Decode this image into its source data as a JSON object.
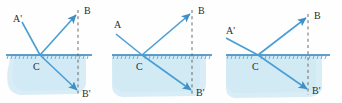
{
  "figure": {
    "panel_count": 3,
    "colors": {
      "ray": "#4a9ed4",
      "ray_dark": "#3f8ec4",
      "interface": "#2f7fb5",
      "water_fill": "#d9edf6",
      "water_fill_alt": "#cfe8f4",
      "normal_dashed": "#6a6a6a",
      "label": "#2b2b2b",
      "background": "#fefefe"
    }
  },
  "panels": [
    {
      "id": "panel-1",
      "name": "left-panel",
      "labels": {
        "source": "A'",
        "image_above": "B",
        "image_below": "B'",
        "interface_point": "C"
      },
      "geometry": {
        "interface_y": 55,
        "point_c_x": 40,
        "normal_x": 78,
        "b_y": 12,
        "b_prime_y": 92,
        "source_x": 14,
        "source_y": 18
      },
      "rays": [
        {
          "name": "incident-ray",
          "from": "A'",
          "to": "C",
          "arrow": false
        },
        {
          "name": "reflected-ray",
          "from": "C",
          "to": "B",
          "arrow": true
        },
        {
          "name": "through-ray",
          "from": "C",
          "to": "B'",
          "arrow": true
        }
      ]
    },
    {
      "id": "panel-2",
      "name": "middle-panel",
      "labels": {
        "source": "A",
        "image_above": "B",
        "image_below": "B'",
        "interface_point": "C"
      },
      "geometry": {
        "interface_y": 55,
        "point_c_x": 30,
        "normal_x": 80,
        "b_y": 12,
        "b_prime_y": 92,
        "source_x": 8,
        "source_y": 30
      },
      "rays": [
        {
          "name": "incident-ray",
          "from": "A",
          "to": "C",
          "arrow": false
        },
        {
          "name": "reflected-ray",
          "from": "C",
          "to": "B",
          "arrow": true
        },
        {
          "name": "refracted-ray",
          "from": "C",
          "to": "B'",
          "arrow": true
        }
      ]
    },
    {
      "id": "panel-3",
      "name": "right-panel",
      "labels": {
        "source": "A'",
        "image_above": "B",
        "image_below": "B'",
        "interface_point": "C"
      },
      "geometry": {
        "interface_y": 55,
        "point_c_x": 32,
        "normal_x": 82,
        "b_y": 16,
        "b_prime_y": 90,
        "source_x": 4,
        "source_y": 32
      },
      "rays": [
        {
          "name": "incident-ray",
          "from": "A'",
          "to": "C",
          "arrow": false
        },
        {
          "name": "reflected-ray",
          "from": "C",
          "to": "B",
          "arrow": true
        },
        {
          "name": "through-ray",
          "from": "C",
          "to": "B'",
          "arrow": true
        }
      ]
    }
  ]
}
